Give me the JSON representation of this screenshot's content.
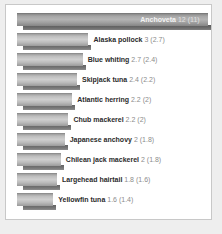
{
  "chart_data": {
    "type": "bar",
    "orientation": "horizontal",
    "title": "",
    "xlabel": "",
    "ylabel": "",
    "value_unit": "million tonnes",
    "value_note": "number in parentheses is the previous period value",
    "grid": false,
    "legend": false,
    "xlim": [
      0,
      12
    ],
    "categories": [
      "Anchoveta",
      "Alaska pollock",
      "Blue whiting",
      "Skipjack tuna",
      "Atlantic herring",
      "Chub mackerel",
      "Japanese anchovy",
      "Chilean jack mackerel",
      "Largehead hairtail",
      "Yellowfin tuna"
    ],
    "series": [
      {
        "name": "current",
        "values": [
          12,
          3,
          2.7,
          2.4,
          2.2,
          2.2,
          2,
          2,
          1.8,
          1.6
        ]
      },
      {
        "name": "previous",
        "values": [
          11,
          2.7,
          2.4,
          2.2,
          2,
          2,
          1.8,
          1.8,
          1.6,
          1.4
        ]
      }
    ]
  },
  "bars": [
    {
      "name": "Anchoveta",
      "value": "12",
      "previous": "(11)",
      "width_pct": 100,
      "label_inside": true
    },
    {
      "name": "Alaska pollock",
      "value": "3",
      "previous": "(2.7)",
      "width_pct": 37.5,
      "label_inside": false
    },
    {
      "name": "Blue whiting",
      "value": "2.7",
      "previous": "(2.4)",
      "width_pct": 34.5,
      "label_inside": false
    },
    {
      "name": "Skipjack tuna",
      "value": "2.4",
      "previous": "(2.2)",
      "width_pct": 31.5,
      "label_inside": false
    },
    {
      "name": "Atlantic herring",
      "value": "2.2",
      "previous": "(2)",
      "width_pct": 29,
      "label_inside": false
    },
    {
      "name": "Chub mackerel",
      "value": "2.2",
      "previous": "(2)",
      "width_pct": 27,
      "label_inside": false
    },
    {
      "name": "Japanese anchovy",
      "value": "2",
      "previous": "(1.8)",
      "width_pct": 25,
      "label_inside": false
    },
    {
      "name": "Chilean jack mackerel",
      "value": "2",
      "previous": "(1.8)",
      "width_pct": 23,
      "label_inside": false
    },
    {
      "name": "Largehead hairtail",
      "value": "1.8",
      "previous": "(1.6)",
      "width_pct": 21,
      "label_inside": false
    },
    {
      "name": "Yellowfin tuna",
      "value": "1.6",
      "previous": "(1.4)",
      "width_pct": 19,
      "label_inside": false
    }
  ]
}
